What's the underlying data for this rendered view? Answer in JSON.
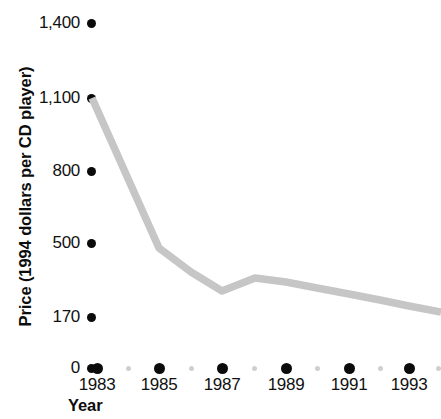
{
  "chart_data": {
    "type": "line",
    "title": "",
    "xlabel": "Year",
    "ylabel": "Price (1994 dollars per CD player)",
    "grid": false,
    "legend": "none",
    "x": [
      1983,
      1984,
      1985,
      1986,
      1987,
      1988,
      1989,
      1990,
      1991,
      1992,
      1993,
      1994
    ],
    "series": [
      {
        "name": "Price per CD player",
        "values": [
          1100,
          760,
          480,
          390,
          310,
          330,
          350,
          320,
          290,
          255,
          215,
          185
        ]
      }
    ],
    "x_tick_labels": [
      "1983",
      "1985",
      "1987",
      "1989",
      "1991",
      "1993"
    ],
    "x_tick_values": [
      1983,
      1985,
      1987,
      1989,
      1991,
      1993
    ],
    "x_minor_tick_values": [
      1984,
      1986,
      1988,
      1990,
      1992,
      1994
    ],
    "y_tick_labels": [
      "1,400",
      "1,100",
      "800",
      "500",
      "170",
      "0"
    ],
    "y_tick_values": [
      1400,
      1100,
      800,
      500,
      170,
      0
    ],
    "xlim": [
      1983,
      1994
    ],
    "ylim": [
      0,
      1400
    ],
    "yscale": "nonlinear-custom",
    "colors": {
      "line": "#c6c6c6",
      "tick_dot": "#0b0b0b",
      "minor_tick_dot": "#cfcfcf",
      "text": "#111111",
      "background": "#ffffff"
    }
  },
  "axes": {
    "y_title": "Price (1994 dollars per CD player)",
    "x_title": "Year",
    "y_ticks": [
      {
        "label": "1,400",
        "value": 1400,
        "py": 23
      },
      {
        "label": "1,100",
        "value": 1100,
        "py": 98
      },
      {
        "label": "800",
        "value": 800,
        "py": 171
      },
      {
        "label": "500",
        "value": 500,
        "py": 243
      },
      {
        "label": "170",
        "value": 170,
        "py": 317
      },
      {
        "label": "0",
        "value": 0,
        "py": 368
      }
    ],
    "x_ticks": [
      {
        "label": "1983",
        "value": 1983,
        "px": 97
      },
      {
        "label": "1985",
        "value": 1985,
        "px": 159
      },
      {
        "label": "1987",
        "value": 1987,
        "px": 222
      },
      {
        "label": "1989",
        "value": 1989,
        "px": 286
      },
      {
        "label": "1991",
        "value": 1991,
        "px": 349
      },
      {
        "label": "1993",
        "value": 1993,
        "px": 409
      }
    ],
    "x_minor_ticks": [
      {
        "value": 1984,
        "px": 128
      },
      {
        "value": 1986,
        "px": 191
      },
      {
        "value": 1988,
        "px": 254
      },
      {
        "value": 1990,
        "px": 317
      },
      {
        "value": 1992,
        "px": 380
      },
      {
        "value": 1994,
        "px": 438
      }
    ]
  },
  "plot_geometry": {
    "line_points_px": [
      [
        92,
        98
      ],
      [
        159,
        248
      ],
      [
        191,
        272
      ],
      [
        222,
        291
      ],
      [
        255,
        278
      ],
      [
        286,
        282
      ],
      [
        317,
        288
      ],
      [
        349,
        294
      ],
      [
        380,
        300
      ],
      [
        409,
        306
      ],
      [
        441,
        312
      ]
    ]
  }
}
